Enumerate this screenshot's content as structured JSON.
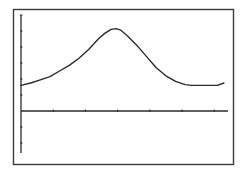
{
  "window": {
    "background": "#ffffff",
    "ink": "#2a2a2a",
    "frame_color": "#3a3a3a"
  },
  "chart_data": {
    "type": "line",
    "title": "",
    "xlabel": "",
    "ylabel": "",
    "grid": false,
    "legend": null,
    "xlim": [
      0,
      6.5
    ],
    "ylim": [
      -2.6,
      6.1
    ],
    "x_ticks": [
      1,
      2,
      3,
      4,
      5,
      6
    ],
    "y_ticks": [
      -2,
      -1,
      1,
      2,
      3,
      4,
      5,
      6
    ],
    "tick_labels_shown": false,
    "series": [
      {
        "name": "curve",
        "x": [
          0.0,
          0.3,
          0.6,
          0.9,
          1.2,
          1.5,
          1.8,
          2.1,
          2.4,
          2.6,
          2.8,
          2.95,
          3.1,
          3.3,
          3.6,
          3.9,
          4.2,
          4.5,
          4.8,
          5.1,
          5.3,
          5.6,
          5.9,
          6.1,
          6.3
        ],
        "y": [
          1.6,
          1.75,
          1.95,
          2.15,
          2.5,
          2.85,
          3.3,
          3.85,
          4.5,
          4.85,
          5.1,
          5.15,
          5.05,
          4.7,
          4.1,
          3.4,
          2.7,
          2.2,
          1.85,
          1.65,
          1.6,
          1.6,
          1.6,
          1.6,
          1.75
        ]
      }
    ]
  }
}
